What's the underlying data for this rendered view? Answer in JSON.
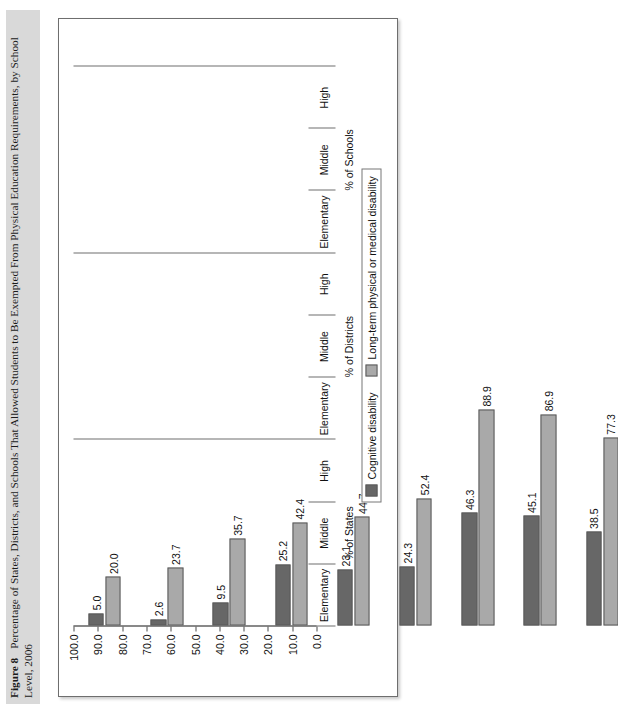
{
  "figure": {
    "number_label": "Figure 8",
    "caption": "Percentage of States, Districts, and Schools That Allowed Students to Be Exempted From Physical Education Requirements, by School Level, 2006"
  },
  "legend": {
    "position": "bottom-center",
    "items": [
      {
        "label": "Cognitive disability",
        "color": "#676767"
      },
      {
        "label": "Long-term physical or medical disability",
        "color": "#a9a9a9"
      }
    ]
  },
  "axis": {
    "value_ticks": [
      "0.0",
      "10.0",
      "20.0",
      "30.0",
      "40.0",
      "50.0",
      "60.0",
      "70.0",
      "80.0",
      "90.0",
      "100.0"
    ],
    "value_min": 0,
    "value_max": 100
  },
  "groups": [
    {
      "name": "% of States",
      "levels": [
        "Elementary",
        "Middle",
        "High"
      ]
    },
    {
      "name": "% of Districts",
      "levels": [
        "Elementary",
        "Middle",
        "High"
      ]
    },
    {
      "name": "% of Schools",
      "levels": [
        "Elementary",
        "Middle",
        "High"
      ]
    }
  ],
  "chart_data": {
    "type": "bar",
    "title": "Percentage of States, Districts, and Schools That Allowed Students to Be Exempted From Physical Education Requirements, by School Level, 2006",
    "xlabel": "",
    "ylabel": "",
    "ylim": [
      0,
      100
    ],
    "grid": false,
    "orientation": "vertical",
    "categories": [
      "% of States - Elementary",
      "% of States - Middle",
      "% of States - High",
      "% of Districts - Elementary",
      "% of Districts - Middle",
      "% of Districts - High",
      "% of Schools - Elementary",
      "% of Schools - Middle",
      "% of Schools - High"
    ],
    "series": [
      {
        "name": "Cognitive disability",
        "color": "#676767",
        "values": [
          5.0,
          2.6,
          9.5,
          25.2,
          23.1,
          24.3,
          46.3,
          45.1,
          38.5
        ],
        "labels": [
          "5.0",
          "2.6",
          "9.5",
          "25.2",
          "23.1",
          "24.3",
          "46.3",
          "45.1",
          "38.5"
        ]
      },
      {
        "name": "Long-term physical or medical disability",
        "color": "#a9a9a9",
        "values": [
          20.0,
          23.7,
          35.7,
          42.4,
          44.7,
          52.4,
          88.9,
          86.9,
          77.3
        ],
        "labels": [
          "20.0",
          "23.7",
          "35.7",
          "42.4",
          "44.7",
          "52.4",
          "88.9",
          "86.9",
          "77.3"
        ]
      }
    ]
  }
}
